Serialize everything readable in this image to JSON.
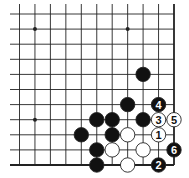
{
  "diagram": {
    "type": "go-board-problem",
    "board_fragment": "bottom-right corner",
    "columns": 11,
    "rows": 11,
    "colors": {
      "line": "#222222",
      "black": "#111111",
      "white": "#ffffff",
      "background": "#ffffff"
    },
    "star_points": [
      {
        "col": 1,
        "row": 1
      },
      {
        "col": 7,
        "row": 1
      },
      {
        "col": 1,
        "row": 7
      }
    ],
    "stones": [
      {
        "color": "black",
        "col": 8,
        "row": 4,
        "label": ""
      },
      {
        "color": "black",
        "col": 7,
        "row": 6,
        "label": ""
      },
      {
        "color": "black",
        "col": 9,
        "row": 6,
        "label": "4"
      },
      {
        "color": "black",
        "col": 5,
        "row": 7,
        "label": ""
      },
      {
        "color": "black",
        "col": 6,
        "row": 7,
        "label": ""
      },
      {
        "color": "black",
        "col": 8,
        "row": 7,
        "label": ""
      },
      {
        "color": "white",
        "col": 9,
        "row": 7,
        "label": "3"
      },
      {
        "color": "white",
        "col": 10,
        "row": 7,
        "label": "5"
      },
      {
        "color": "black",
        "col": 4,
        "row": 8,
        "label": ""
      },
      {
        "color": "black",
        "col": 6,
        "row": 8,
        "label": ""
      },
      {
        "color": "white",
        "col": 7,
        "row": 8,
        "label": ""
      },
      {
        "color": "white",
        "col": 9,
        "row": 8,
        "label": "1"
      },
      {
        "color": "black",
        "col": 5,
        "row": 9,
        "label": ""
      },
      {
        "color": "white",
        "col": 6,
        "row": 9,
        "label": ""
      },
      {
        "color": "white",
        "col": 8,
        "row": 9,
        "label": ""
      },
      {
        "color": "black",
        "col": 10,
        "row": 9,
        "label": "6"
      },
      {
        "color": "black",
        "col": 5,
        "row": 10,
        "label": ""
      },
      {
        "color": "white",
        "col": 7,
        "row": 10,
        "label": ""
      },
      {
        "color": "black",
        "col": 9,
        "row": 10,
        "label": "2"
      }
    ]
  }
}
